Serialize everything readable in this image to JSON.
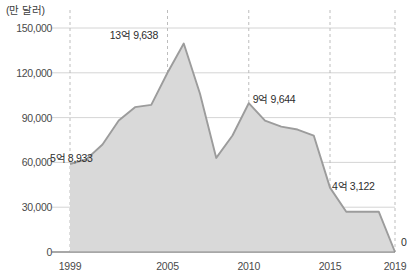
{
  "chart_data": {
    "type": "area",
    "title": "",
    "subtitle": "",
    "unit_label": "(만 달러)",
    "xlabel": "",
    "ylabel": "",
    "xlim": [
      1999,
      2019
    ],
    "ylim": [
      0,
      150000
    ],
    "grid": true,
    "legend": "none",
    "x_ticks": [
      "1999",
      "2005",
      "2010",
      "2015",
      "2019"
    ],
    "x_tick_values": [
      1999,
      2005,
      2010,
      2015,
      2019
    ],
    "y_ticks": [
      "0",
      "30,000",
      "60,000",
      "90,000",
      "120,000",
      "150,000"
    ],
    "y_tick_values": [
      0,
      30000,
      60000,
      90000,
      120000,
      150000
    ],
    "x": [
      1999,
      2000,
      2001,
      2002,
      2003,
      2004,
      2005,
      2006,
      2007,
      2008,
      2009,
      2010,
      2011,
      2012,
      2013,
      2014,
      2015,
      2016,
      2017,
      2018,
      2019
    ],
    "values": [
      58933,
      62000,
      72000,
      88000,
      97000,
      98500,
      120000,
      139638,
      106000,
      63000,
      78000,
      99644,
      88000,
      84000,
      82000,
      78000,
      43122,
      27000,
      27000,
      27000,
      0
    ],
    "series": [
      {
        "name": "수출액",
        "values": [
          58933,
          62000,
          72000,
          88000,
          97000,
          98500,
          120000,
          139638,
          106000,
          63000,
          78000,
          99644,
          88000,
          84000,
          82000,
          78000,
          43122,
          27000,
          27000,
          27000,
          0
        ]
      }
    ],
    "annotations": [
      {
        "label": "5억 8,933",
        "x": 1999,
        "y": 58933
      },
      {
        "label": "13억 9,638",
        "x": 2006,
        "y": 139638
      },
      {
        "label": "9억 9,644",
        "x": 2010,
        "y": 99644
      },
      {
        "label": "4억 3,122",
        "x": 2015,
        "y": 43122
      },
      {
        "label": "0",
        "x": 2019,
        "y": 0
      }
    ],
    "colors": {
      "area_fill": "#d9d9d9",
      "line_stroke": "#9c9c9c",
      "gridline": "#c9c9c9",
      "axis": "#8a8a8a",
      "text": "#3c3c3c"
    }
  }
}
